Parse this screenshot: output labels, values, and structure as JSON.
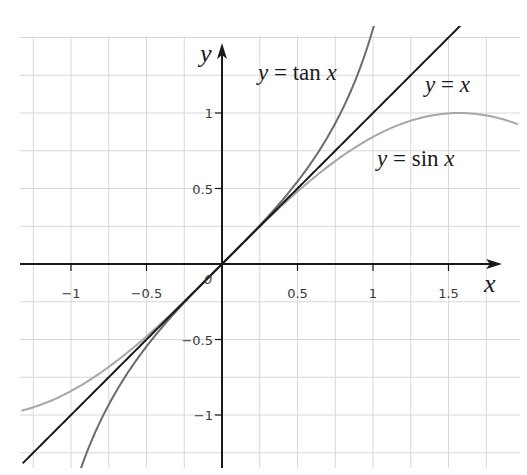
{
  "chart_data": {
    "type": "line",
    "title": "",
    "xlabel": "x",
    "ylabel": "y",
    "xlim": [
      -1.32,
      1.96
    ],
    "ylim": [
      -1.35,
      1.5
    ],
    "grid": true,
    "grid_step": 0.25,
    "x_ticks": [
      -1,
      -0.5,
      0.5,
      1,
      1.5
    ],
    "x_tick_labels": [
      "−1",
      "−0.5",
      "0.5",
      "1",
      "1.5"
    ],
    "y_ticks": [
      1,
      0.5,
      -0.5,
      -1
    ],
    "y_tick_labels": [
      "1",
      "0.5",
      "−0.5",
      "−1"
    ],
    "origin_label": "0",
    "series": [
      {
        "name": "y = tan x",
        "function": "tan",
        "color": "#6b6b6b",
        "x_range": [
          -0.95,
          1.03
        ]
      },
      {
        "name": "y = x",
        "function": "identity",
        "color": "#1a1a1a",
        "x_range": [
          -1.32,
          1.6
        ]
      },
      {
        "name": "y = sin x",
        "function": "sin",
        "color": "#a6a6a6",
        "x_range": [
          -1.33,
          1.96
        ]
      }
    ],
    "sample_points": {
      "x": [
        -1,
        -0.5,
        0,
        0.5,
        1,
        1.5707
      ],
      "tan": [
        -1.557,
        -0.546,
        0,
        0.546,
        1.557,
        null
      ],
      "identity": [
        -1,
        -0.5,
        0,
        0.5,
        1,
        1.5707
      ],
      "sin": [
        -0.841,
        -0.479,
        0,
        0.479,
        0.841,
        1
      ]
    },
    "annotations": [
      {
        "text_prefix": "y",
        "text_eq": " = ",
        "text_fn": "tan ",
        "text_var": "x",
        "x": 258,
        "y": 80
      },
      {
        "text_prefix": "y",
        "text_eq": " = ",
        "text_fn": "",
        "text_var": "x",
        "x": 425,
        "y": 92
      },
      {
        "text_prefix": "y",
        "text_eq": " = ",
        "text_fn": "sin ",
        "text_var": "x",
        "x": 377,
        "y": 166
      }
    ],
    "legend": "inline labels near curves"
  },
  "layout": {
    "origin_px": [
      222,
      264
    ],
    "scale_px_per_unit": 151,
    "plot_box": {
      "left": 20,
      "right": 520,
      "top": 26,
      "bottom": 468
    },
    "grid_color": "#d8d8d8",
    "axis_color": "#1a1a1a"
  },
  "labels": {
    "x_axis": "x",
    "y_axis": "y",
    "origin": "0",
    "tan_label": {
      "y": "y",
      "eq": " = ",
      "fn": "tan ",
      "x": "x"
    },
    "identity_label": {
      "y": "y",
      "eq": " = ",
      "fn": "",
      "x": "x"
    },
    "sin_label": {
      "y": "y",
      "eq": " = ",
      "fn": "sin ",
      "x": "x"
    }
  }
}
